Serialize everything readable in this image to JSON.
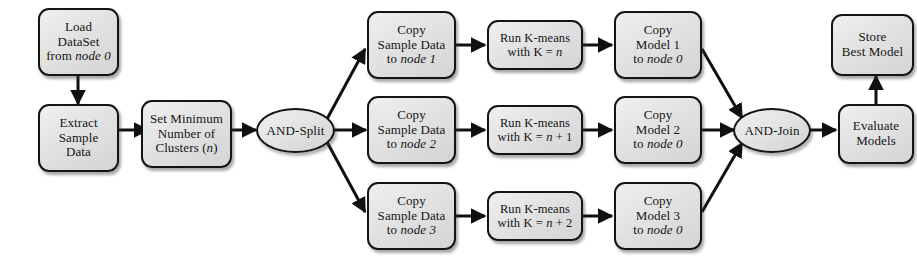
{
  "diagram": {
    "type": "flowchart",
    "colors": {
      "node_fill": "#e3e3e3",
      "node_border": "#141414",
      "edge": "#101010",
      "background": "#ffffff",
      "text": "#151515"
    },
    "nodes": [
      {
        "id": "load_dataset",
        "name": "load-dataset",
        "shape": "rounded-rect",
        "lines": [
          [
            {
              "t": "Load",
              "i": false
            }
          ],
          [
            {
              "t": "DataSet",
              "i": false
            }
          ],
          [
            {
              "t": "from ",
              "i": false
            },
            {
              "t": "node 0",
              "i": true
            }
          ]
        ],
        "text": "Load DataSet from node 0"
      },
      {
        "id": "extract_sample",
        "name": "extract-sample-data",
        "shape": "rounded-rect",
        "lines": [
          [
            {
              "t": "Extract",
              "i": false
            }
          ],
          [
            {
              "t": "Sample",
              "i": false
            }
          ],
          [
            {
              "t": "Data",
              "i": false
            }
          ]
        ],
        "text": "Extract Sample Data"
      },
      {
        "id": "set_minimum",
        "name": "set-minimum-clusters",
        "shape": "rounded-rect",
        "lines": [
          [
            {
              "t": "Set Minimum",
              "i": false
            }
          ],
          [
            {
              "t": "Number of",
              "i": false
            }
          ],
          [
            {
              "t": "Clusters (",
              "i": false
            },
            {
              "t": "n",
              "i": true
            },
            {
              "t": ")",
              "i": false
            }
          ]
        ],
        "text": "Set Minimum Number of Clusters (n)"
      },
      {
        "id": "and_split",
        "name": "and-split-gateway",
        "shape": "ellipse",
        "lines": [
          [
            {
              "t": "AND-Split",
              "i": false
            }
          ]
        ],
        "text": "AND-Split"
      },
      {
        "id": "copy_sample_1",
        "name": "copy-sample-data-node-1",
        "shape": "rounded-rect",
        "lines": [
          [
            {
              "t": "Copy",
              "i": false
            }
          ],
          [
            {
              "t": "Sample Data",
              "i": false
            }
          ],
          [
            {
              "t": "to ",
              "i": false
            },
            {
              "t": "node 1",
              "i": true
            }
          ]
        ],
        "text": "Copy Sample Data to node 1"
      },
      {
        "id": "run_kmeans_1",
        "name": "run-kmeans-k-n",
        "shape": "rounded-rect",
        "lines": [
          [
            {
              "t": "Run K-means",
              "i": false
            }
          ],
          [
            {
              "t": "with K = ",
              "i": false
            },
            {
              "t": "n",
              "i": true
            }
          ]
        ],
        "text": "Run K-means with K = n"
      },
      {
        "id": "copy_model_1",
        "name": "copy-model-1-node-0",
        "shape": "rounded-rect",
        "lines": [
          [
            {
              "t": "Copy",
              "i": false
            }
          ],
          [
            {
              "t": "Model 1",
              "i": false
            }
          ],
          [
            {
              "t": "to ",
              "i": false
            },
            {
              "t": "node 0",
              "i": true
            }
          ]
        ],
        "text": "Copy Model 1 to node 0"
      },
      {
        "id": "copy_sample_2",
        "name": "copy-sample-data-node-2",
        "shape": "rounded-rect",
        "lines": [
          [
            {
              "t": "Copy",
              "i": false
            }
          ],
          [
            {
              "t": "Sample Data",
              "i": false
            }
          ],
          [
            {
              "t": "to ",
              "i": false
            },
            {
              "t": "node 2",
              "i": true
            }
          ]
        ],
        "text": "Copy Sample Data to node 2"
      },
      {
        "id": "run_kmeans_2",
        "name": "run-kmeans-k-n-plus-1",
        "shape": "rounded-rect",
        "lines": [
          [
            {
              "t": "Run K-means",
              "i": false
            }
          ],
          [
            {
              "t": "with K = ",
              "i": false
            },
            {
              "t": "n",
              "i": true
            },
            {
              "t": " + 1",
              "i": false
            }
          ]
        ],
        "text": "Run K-means with K = n + 1"
      },
      {
        "id": "copy_model_2",
        "name": "copy-model-2-node-0",
        "shape": "rounded-rect",
        "lines": [
          [
            {
              "t": "Copy",
              "i": false
            }
          ],
          [
            {
              "t": "Model 2",
              "i": false
            }
          ],
          [
            {
              "t": "to ",
              "i": false
            },
            {
              "t": "node 0",
              "i": true
            }
          ]
        ],
        "text": "Copy Model 2 to node 0"
      },
      {
        "id": "copy_sample_3",
        "name": "copy-sample-data-node-3",
        "shape": "rounded-rect",
        "lines": [
          [
            {
              "t": "Copy",
              "i": false
            }
          ],
          [
            {
              "t": "Sample Data",
              "i": false
            }
          ],
          [
            {
              "t": "to ",
              "i": false
            },
            {
              "t": "node 3",
              "i": true
            }
          ]
        ],
        "text": "Copy Sample Data to node 3"
      },
      {
        "id": "run_kmeans_3",
        "name": "run-kmeans-k-n-plus-2",
        "shape": "rounded-rect",
        "lines": [
          [
            {
              "t": "Run K-means",
              "i": false
            }
          ],
          [
            {
              "t": "with K = ",
              "i": false
            },
            {
              "t": "n",
              "i": true
            },
            {
              "t": " + 2",
              "i": false
            }
          ]
        ],
        "text": "Run K-means with K = n + 2"
      },
      {
        "id": "copy_model_3",
        "name": "copy-model-3-node-0",
        "shape": "rounded-rect",
        "lines": [
          [
            {
              "t": "Copy",
              "i": false
            }
          ],
          [
            {
              "t": "Model 3",
              "i": false
            }
          ],
          [
            {
              "t": "to ",
              "i": false
            },
            {
              "t": "node 0",
              "i": true
            }
          ]
        ],
        "text": "Copy Model 3 to node 0"
      },
      {
        "id": "and_join",
        "name": "and-join-gateway",
        "shape": "ellipse",
        "lines": [
          [
            {
              "t": "AND-Join",
              "i": false
            }
          ]
        ],
        "text": "AND-Join"
      },
      {
        "id": "evaluate_models",
        "name": "evaluate-models",
        "shape": "rounded-rect",
        "lines": [
          [
            {
              "t": "Evaluate",
              "i": false
            }
          ],
          [
            {
              "t": "Models",
              "i": false
            }
          ]
        ],
        "text": "Evaluate Models"
      },
      {
        "id": "store_best_model",
        "name": "store-best-model",
        "shape": "rounded-rect",
        "lines": [
          [
            {
              "t": "Store",
              "i": false
            }
          ],
          [
            {
              "t": "Best Model",
              "i": false
            }
          ]
        ],
        "text": "Store Best Model"
      }
    ],
    "edges": [
      {
        "from": "load_dataset",
        "to": "extract_sample"
      },
      {
        "from": "extract_sample",
        "to": "set_minimum"
      },
      {
        "from": "set_minimum",
        "to": "and_split"
      },
      {
        "from": "and_split",
        "to": "copy_sample_1"
      },
      {
        "from": "and_split",
        "to": "copy_sample_2"
      },
      {
        "from": "and_split",
        "to": "copy_sample_3"
      },
      {
        "from": "copy_sample_1",
        "to": "run_kmeans_1"
      },
      {
        "from": "run_kmeans_1",
        "to": "copy_model_1"
      },
      {
        "from": "copy_sample_2",
        "to": "run_kmeans_2"
      },
      {
        "from": "run_kmeans_2",
        "to": "copy_model_2"
      },
      {
        "from": "copy_sample_3",
        "to": "run_kmeans_3"
      },
      {
        "from": "run_kmeans_3",
        "to": "copy_model_3"
      },
      {
        "from": "copy_model_1",
        "to": "and_join"
      },
      {
        "from": "copy_model_2",
        "to": "and_join"
      },
      {
        "from": "copy_model_3",
        "to": "and_join"
      },
      {
        "from": "and_join",
        "to": "evaluate_models"
      },
      {
        "from": "evaluate_models",
        "to": "store_best_model"
      }
    ]
  }
}
